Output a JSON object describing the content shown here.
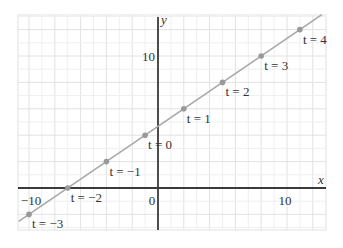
{
  "chart_data": {
    "type": "line",
    "title": "",
    "xlabel": "x",
    "ylabel": "y",
    "xlim": [
      -10.8,
      12.8
    ],
    "ylim": [
      -3.2,
      13.0
    ],
    "grid": true,
    "x_ticks": [
      {
        "value": -10,
        "label": "−10"
      },
      {
        "value": 0,
        "label": "0"
      },
      {
        "value": 10,
        "label": "10"
      }
    ],
    "y_ticks": [
      {
        "value": 10,
        "label": "10"
      }
    ],
    "parametric": {
      "x": "-1 + 3t",
      "y": "4 + 2t"
    },
    "series": [
      {
        "name": "line",
        "color": "#a8a8a8",
        "points": [
          {
            "t": -3,
            "x": -10,
            "y": -2,
            "label": "t = −3"
          },
          {
            "t": -2,
            "x": -7,
            "y": 0,
            "label": "t = −2"
          },
          {
            "t": -1,
            "x": -4,
            "y": 2,
            "label": "t = −1"
          },
          {
            "t": 0,
            "x": -1,
            "y": 4,
            "label": "t = 0"
          },
          {
            "t": 1,
            "x": 2,
            "y": 6,
            "label": "t = 1"
          },
          {
            "t": 2,
            "x": 5,
            "y": 8,
            "label": "t = 2"
          },
          {
            "t": 3,
            "x": 8,
            "y": 10,
            "label": "t = 3"
          },
          {
            "t": 4,
            "x": 11,
            "y": 12,
            "label": "t = 4"
          }
        ]
      }
    ]
  },
  "colors": {
    "grid_minor": "#efefef",
    "grid_major": "#e2e2e2",
    "axis": "#3a3a3a",
    "line": "#a8a8a8",
    "point": "#999999"
  }
}
